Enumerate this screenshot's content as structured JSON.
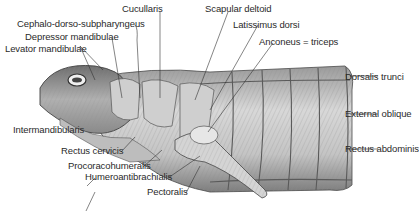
{
  "diagram": {
    "labels": [
      {
        "id": "cucullaris",
        "text": "Cucullaris"
      },
      {
        "id": "scapular-deltoid",
        "text": "Scapular deltoid"
      },
      {
        "id": "cephalo-dorso-subpharyngeus",
        "text": "Cephalo-dorso-subpharyngeus"
      },
      {
        "id": "latissimus-dorsi",
        "text": "Latissimus dorsi"
      },
      {
        "id": "depressor-mandibulae",
        "text": "Depressor mandibulae"
      },
      {
        "id": "anconeus",
        "text": "Anconeus = triceps"
      },
      {
        "id": "levator-mandibulae",
        "text": "Levator mandibulae"
      },
      {
        "id": "dorsalis-trunci",
        "text": "Dorsalis trunci"
      },
      {
        "id": "external-oblique",
        "text": "External oblique"
      },
      {
        "id": "intermandibularis",
        "text": "Intermandibularis"
      },
      {
        "id": "rectus-abdominis",
        "text": "Rectus abdominis"
      },
      {
        "id": "rectus-cervicis",
        "text": "Rectus cervicis"
      },
      {
        "id": "procoracohumeralis",
        "text": "Procoracohumeralis"
      },
      {
        "id": "humeroantibrachialis",
        "text": "Humeroantibrachialis"
      },
      {
        "id": "pectoralis",
        "text": "Pectoralis"
      }
    ]
  }
}
